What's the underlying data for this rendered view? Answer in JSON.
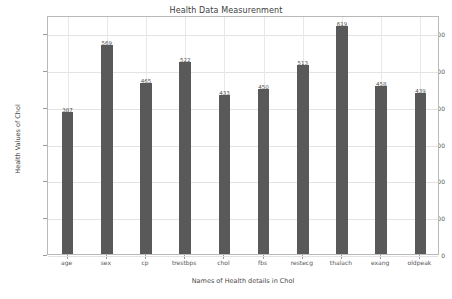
{
  "chart_data": {
    "type": "bar",
    "title": "Health Data Measurenment",
    "xlabel": "Names of Health details in Chol",
    "ylabel": "Health Values of Chol",
    "categories": [
      "age",
      "sex",
      "cp",
      "trestbps",
      "chol",
      "fbs",
      "restecg",
      "thalach",
      "exang",
      "oldpeak"
    ],
    "values": [
      387,
      569,
      465,
      522,
      433,
      450,
      513,
      619,
      458,
      439
    ],
    "yticks": [
      0,
      100,
      200,
      300,
      400,
      500,
      600
    ],
    "ylim": [
      0,
      650
    ],
    "grid": true,
    "legend": null,
    "bar_color": "#595959",
    "show_value_labels": true
  }
}
